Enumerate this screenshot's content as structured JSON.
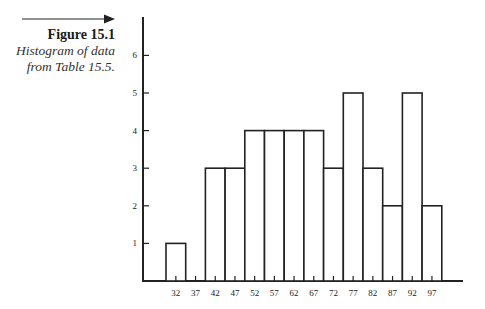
{
  "caption": {
    "title": "Figure 15.1",
    "description_line1": "Histogram of data",
    "description_line2": "from Table 15.5."
  },
  "colors": {
    "ink": "#222222",
    "bar_fill": "#ffffff"
  },
  "chart_data": {
    "type": "bar",
    "title": "Histogram of data from Table 15.5.",
    "xlabel": "",
    "ylabel": "",
    "categories": [
      "32",
      "37",
      "42",
      "47",
      "52",
      "57",
      "62",
      "67",
      "72",
      "77",
      "82",
      "87",
      "92",
      "97"
    ],
    "values": [
      1,
      0,
      3,
      3,
      4,
      4,
      4,
      4,
      3,
      5,
      3,
      2,
      5,
      2
    ],
    "yticks": [
      "1",
      "2",
      "3",
      "4",
      "5",
      "6"
    ],
    "ylim": [
      0,
      7
    ],
    "grid": false,
    "legend": null
  }
}
